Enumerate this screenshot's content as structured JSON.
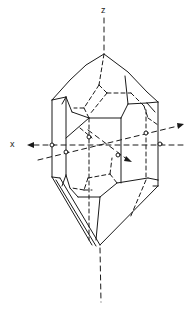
{
  "diagram": {
    "type": "crystal-axes-drawing",
    "axis_labels": {
      "z": "z",
      "x": "x"
    },
    "colors": {
      "line": "#1a1a1a",
      "background": "#ffffff"
    }
  }
}
